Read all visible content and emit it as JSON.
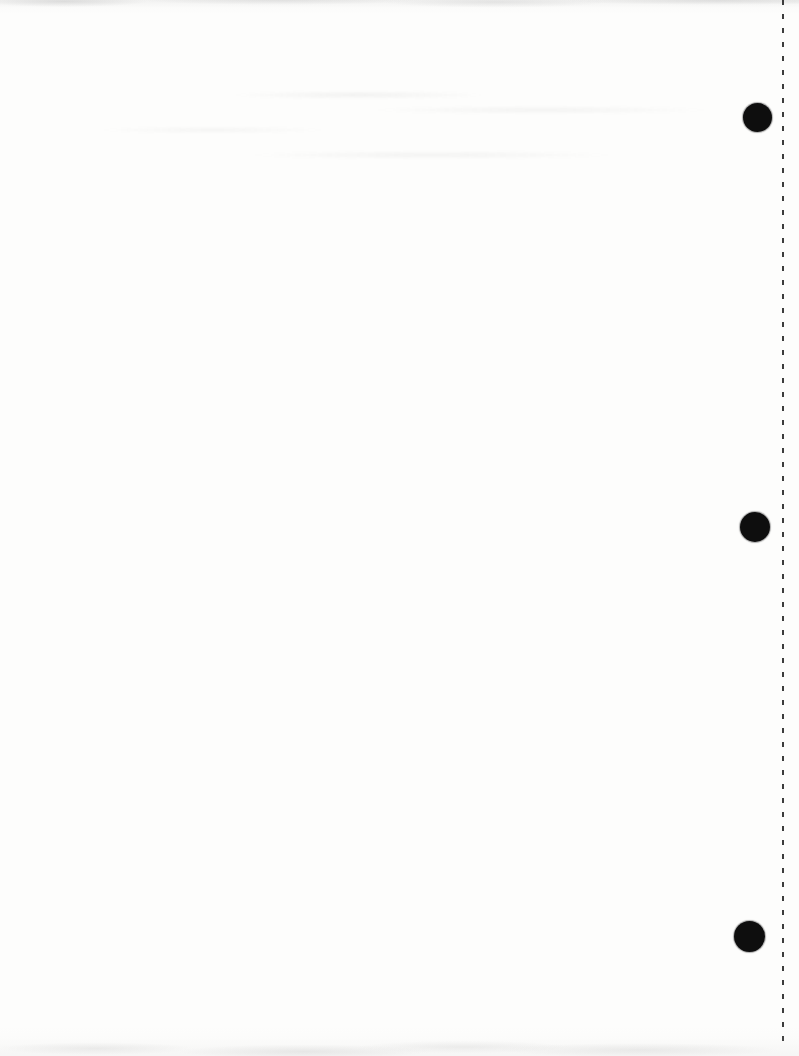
{
  "page": {
    "kind": "scanned-blank-page",
    "width": 799,
    "height": 1056,
    "paper_color": "#fdfdfc",
    "text_content": "",
    "hole_color": "#0e0e0e",
    "hole_punches": [
      {
        "cx": 757,
        "cy": 117,
        "diameter": 29
      },
      {
        "cx": 755,
        "cy": 527,
        "diameter": 30
      },
      {
        "cx": 749,
        "cy": 936,
        "diameter": 31
      }
    ],
    "perforation_line": {
      "x": 782,
      "top": 0,
      "bottom": 1045,
      "dash_length": 5,
      "gap_length": 9,
      "color": "#3c3c3c"
    }
  }
}
